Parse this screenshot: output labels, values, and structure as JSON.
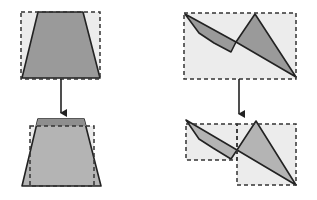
{
  "diagram": {
    "colors": {
      "background": "#ffffff",
      "box_fill": "#ececec",
      "shape_fill_dark": "#9a9a9a",
      "shape_fill_light": "#b4b4b4",
      "stroke": "#222222",
      "dashed_stroke": "#333333"
    },
    "panels": [
      {
        "id": "trapezoid-before",
        "bounding_boxes": [
          {
            "x": 21,
            "y": 12,
            "w": 79,
            "h": 67
          }
        ],
        "shapes": [
          {
            "type": "trapezoid",
            "points": "38,12 83,12 100,78 22,78",
            "fill": "#9a9a9a"
          }
        ]
      },
      {
        "id": "trapezoid-after",
        "bounding_boxes": [
          {
            "x": 30,
            "y": 126,
            "w": 64,
            "h": 60
          }
        ],
        "shapes": [
          {
            "type": "trapezoid",
            "points": "38,119 84,119 101,186 22,186",
            "fill": "#b4b4b4"
          },
          {
            "type": "cap-band",
            "points": "38,119 84,119 86,126 36,126",
            "fill": "#8e8e8e"
          }
        ]
      },
      {
        "id": "polygon-before",
        "bounding_boxes": [
          {
            "x": 184,
            "y": 13,
            "w": 112,
            "h": 66
          }
        ],
        "shapes": [
          {
            "type": "polygon-left",
            "points": "185,14 199,33 214,43 231,52 236,42",
            "fill": "#9a9a9a"
          },
          {
            "type": "triangle-right",
            "points": "236,42 255,14 296,77",
            "fill": "#9a9a9a"
          }
        ]
      },
      {
        "id": "polygon-after",
        "bounding_boxes": [
          {
            "x": 186,
            "y": 124,
            "w": 51,
            "h": 36
          },
          {
            "x": 237,
            "y": 124,
            "w": 59,
            "h": 61
          }
        ],
        "shapes": [
          {
            "type": "polygon-left",
            "points": "186,120 199,139 213,148 231,159 237,150",
            "fill": "#b4b4b4"
          },
          {
            "type": "triangle-right",
            "points": "237,150 256,121 296,185",
            "fill": "#b4b4b4"
          }
        ]
      }
    ],
    "arrows": [
      {
        "id": "arrow-left",
        "x": 61,
        "y1": 79,
        "y2": 119
      },
      {
        "id": "arrow-right",
        "x": 239,
        "y1": 79,
        "y2": 120
      }
    ]
  }
}
